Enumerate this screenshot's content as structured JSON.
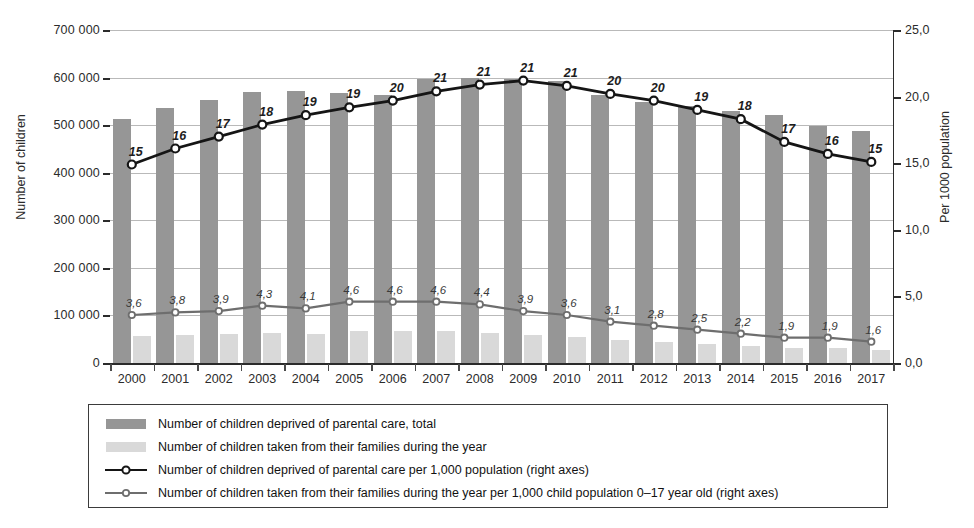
{
  "chart_data": {
    "type": "bar",
    "title": "",
    "xlabel": "",
    "ylabel": "Number of children",
    "y2label": "Per 1000 population",
    "grid": true,
    "legend_position": "bottom",
    "categories": [
      "2000",
      "2001",
      "2002",
      "2003",
      "2004",
      "2005",
      "2006",
      "2007",
      "2008",
      "2009",
      "2010",
      "2011",
      "2012",
      "2013",
      "2014",
      "2015",
      "2016",
      "2017"
    ],
    "ylim": [
      0,
      700000
    ],
    "y2lim": [
      0,
      25
    ],
    "yticks": [
      0,
      100000,
      200000,
      300000,
      400000,
      500000,
      600000,
      700000
    ],
    "ytick_labels": [
      "0",
      "100 000",
      "200 000",
      "300 000",
      "400 000",
      "500 000",
      "600 000",
      "700 000"
    ],
    "y2ticks": [
      0,
      5,
      10,
      15,
      20,
      25
    ],
    "y2tick_labels": [
      "0,0",
      "5,0",
      "10,0",
      "15,0",
      "20,0",
      "25,0"
    ],
    "series": [
      {
        "name": "Number of children deprived of parental care, total",
        "type": "bar",
        "axis": "left",
        "color": "#969696",
        "values": [
          512000,
          536000,
          553000,
          569000,
          572000,
          568000,
          563000,
          597000,
          599000,
          598000,
          592000,
          564000,
          548000,
          541000,
          530000,
          521000,
          498000,
          488000
        ]
      },
      {
        "name": "Number of children taken from their families during the year",
        "type": "bar",
        "axis": "left",
        "color": "#d9d9d9",
        "values": [
          56000,
          59000,
          60000,
          64000,
          62000,
          68000,
          68000,
          68000,
          64000,
          58000,
          54000,
          48000,
          44000,
          40000,
          36000,
          32000,
          32000,
          28000
        ]
      },
      {
        "name": "Number of children deprived of parental care per 1,000 population (right axes)",
        "type": "line",
        "axis": "right",
        "color": "#151515",
        "values": [
          14.9,
          16.1,
          17.0,
          17.9,
          18.6,
          19.2,
          19.7,
          20.4,
          20.9,
          21.2,
          20.8,
          20.2,
          19.7,
          19.0,
          18.3,
          16.6,
          15.7,
          15.1
        ],
        "labels": [
          "15",
          "16",
          "17",
          "18",
          "19",
          "19",
          "20",
          "21",
          "21",
          "21",
          "21",
          "20",
          "20",
          "19",
          "18",
          "17",
          "16",
          "15"
        ]
      },
      {
        "name": "Number of children taken from their families during the year per 1,000 child population 0–17 year old (right axes)",
        "type": "line",
        "axis": "right",
        "color": "#6e6e6e",
        "values": [
          3.6,
          3.8,
          3.9,
          4.3,
          4.1,
          4.6,
          4.6,
          4.6,
          4.4,
          3.9,
          3.6,
          3.1,
          2.8,
          2.5,
          2.2,
          1.9,
          1.9,
          1.6
        ],
        "labels": [
          "3,6",
          "3,8",
          "3,9",
          "4,3",
          "4,1",
          "4,6",
          "4,6",
          "4,6",
          "4,4",
          "3,9",
          "3,6",
          "3,1",
          "2,8",
          "2,5",
          "2,2",
          "1,9",
          "1,9",
          "1,6"
        ]
      }
    ]
  },
  "legend": {
    "items": [
      {
        "key": "swatch-total",
        "label": "Number of children deprived of parental care, total"
      },
      {
        "key": "swatch-taken",
        "label": "Number of children taken from their families during the year"
      },
      {
        "key": "line-dark",
        "label": "Number of children deprived of parental care per 1,000 population (right axes)"
      },
      {
        "key": "line-light",
        "label": "Number of children taken from their families during the year per 1,000 child population 0–17 year old (right axes)"
      }
    ]
  }
}
